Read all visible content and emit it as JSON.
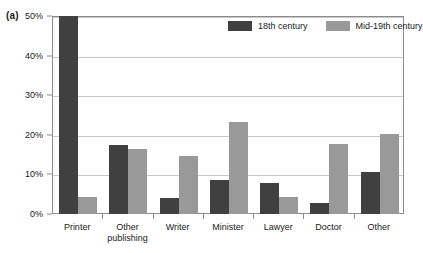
{
  "panel": {
    "label": "(a)"
  },
  "colors": {
    "series_18th": "#404040",
    "series_mid19th": "#999999",
    "gridline": "#c9c9c9",
    "frame": "#8c8c8c",
    "text": "#1a1a1a",
    "background": "#ffffff"
  },
  "legend": {
    "position": "top-right-inside",
    "entries": [
      {
        "label": "18th century",
        "color": "#404040",
        "swatch_name": "legend-swatch-18th-century"
      },
      {
        "label": "Mid-19th century",
        "color": "#999999",
        "swatch_name": "legend-swatch-mid-19th-century"
      }
    ]
  },
  "axes": {
    "y_ticks": [
      "0%",
      "10%",
      "20%",
      "30%",
      "40%",
      "50%"
    ],
    "x_categories": [
      {
        "line1": "Printer",
        "line2": ""
      },
      {
        "line1": "Other",
        "line2": "publishing"
      },
      {
        "line1": "Writer",
        "line2": ""
      },
      {
        "line1": "Minister",
        "line2": ""
      },
      {
        "line1": "Lawyer",
        "line2": ""
      },
      {
        "line1": "Doctor",
        "line2": ""
      },
      {
        "line1": "Other",
        "line2": ""
      }
    ]
  },
  "chart_data": {
    "type": "bar",
    "title": "",
    "subtitle": "",
    "xlabel": "",
    "ylabel": "",
    "ylim": [
      0,
      50
    ],
    "ytick_values": [
      0,
      10,
      20,
      30,
      40,
      50
    ],
    "ytick_labels": [
      "0%",
      "10%",
      "20%",
      "30%",
      "40%",
      "50%"
    ],
    "grid": true,
    "grid_axis": "y",
    "legend_position": "upper right",
    "categories": [
      "Printer",
      "Other publishing",
      "Writer",
      "Minister",
      "Lawyer",
      "Doctor",
      "Other"
    ],
    "series": [
      {
        "name": "18th century",
        "color": "#404040",
        "values": [
          52.0,
          17.5,
          4.0,
          8.7,
          7.8,
          2.8,
          10.5
        ],
        "notes": "Printer bar exceeds the 50% axis maximum and is clipped at the top of the plot area."
      },
      {
        "name": "Mid-19th century",
        "color": "#999999",
        "values": [
          4.2,
          16.5,
          14.7,
          23.3,
          4.3,
          17.7,
          20.3
        ]
      }
    ]
  }
}
